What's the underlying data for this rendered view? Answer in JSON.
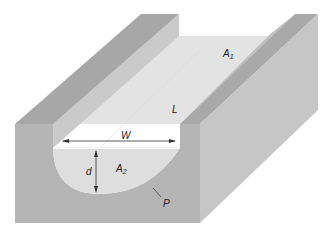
{
  "diagram": {
    "type": "open-channel-cross-section",
    "labels": {
      "A1": {
        "main": "A",
        "sub": "1"
      },
      "L": "L",
      "W": "W",
      "d": "d",
      "A2": {
        "main": "A",
        "sub": "2"
      },
      "P": "P"
    },
    "colors": {
      "background": "#ffffff",
      "wall_top": "#a6a6a6",
      "wall_inner_face": "#c9c9c9",
      "channel_floor": "#e3e3e3",
      "front_face": "#b5b5b5",
      "right_side_face": "#c6c6c6",
      "water_section": "#dedede",
      "water_surface_line": "#f6f6f6",
      "arrow": "#333333"
    }
  }
}
